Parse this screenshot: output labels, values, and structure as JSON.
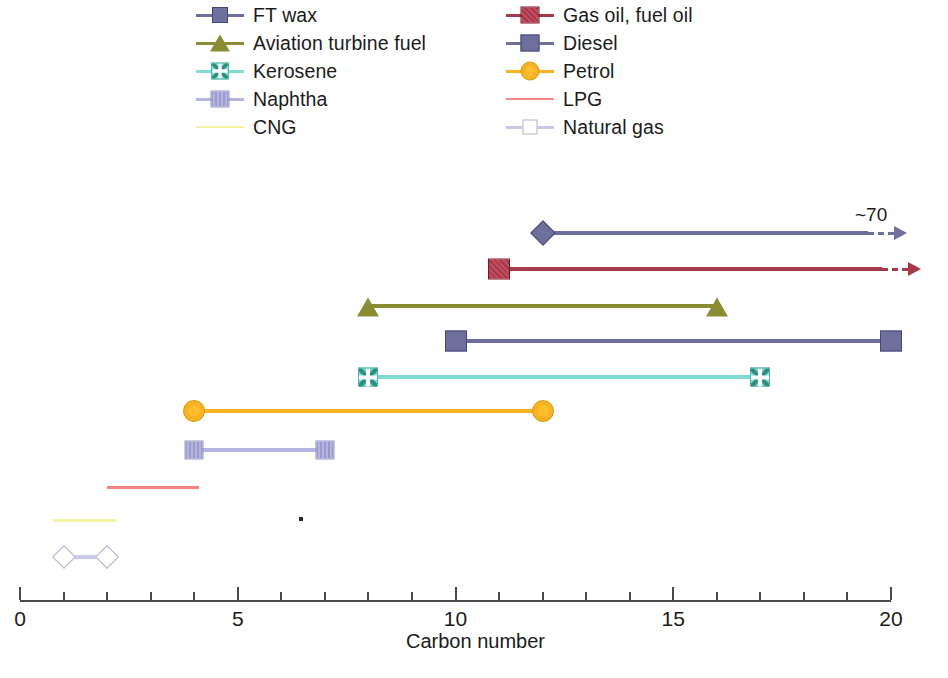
{
  "chart_data": {
    "type": "bar",
    "subtype": "horizontal-range-bars",
    "title": "",
    "xlabel": "Carbon number",
    "ylabel": "",
    "xlim": [
      0,
      20
    ],
    "xticks": [
      0,
      5,
      10,
      15,
      20
    ],
    "xtick_labels": [
      "0",
      "5",
      "10",
      "15",
      "20"
    ],
    "xminor_ticks": [
      1,
      2,
      3,
      4,
      6,
      7,
      8,
      9,
      11,
      12,
      13,
      14,
      16,
      17,
      18,
      19
    ],
    "grid": false,
    "legend_position": "top",
    "series": [
      {
        "name": "FT wax",
        "start": 12,
        "end": 70,
        "end_label": "~70",
        "open_ended": true,
        "marker": "diamond",
        "color": "#6f6f9e",
        "row": 0
      },
      {
        "name": "Gas oil, fuel oil",
        "start": 11,
        "end": 21,
        "end_label": "",
        "open_ended": true,
        "marker": "square-hatched",
        "color": "#a8394a",
        "row": 1
      },
      {
        "name": "Aviation turbine fuel",
        "start": 8,
        "end": 16,
        "end_label": "",
        "open_ended": false,
        "marker": "triangle",
        "color": "#8a8c33",
        "row": 2
      },
      {
        "name": "Diesel",
        "start": 10,
        "end": 20,
        "end_label": "",
        "open_ended": false,
        "marker": "square",
        "color": "#6f6f9e",
        "row": 3
      },
      {
        "name": "Kerosene",
        "start": 8,
        "end": 17,
        "end_label": "",
        "open_ended": false,
        "marker": "x-square",
        "color": "#7edcd2",
        "row": 4
      },
      {
        "name": "Petrol",
        "start": 4,
        "end": 12,
        "end_label": "",
        "open_ended": false,
        "marker": "circle",
        "color": "#f6b323",
        "row": 5
      },
      {
        "name": "Naphtha",
        "start": 4,
        "end": 7,
        "end_label": "",
        "open_ended": false,
        "marker": "square-hatched-light",
        "color": "#b5b5e3",
        "row": 6
      },
      {
        "name": "LPG",
        "start": 2,
        "end": 4.1,
        "end_label": "",
        "open_ended": false,
        "marker": "none",
        "color": "#f88383",
        "row": 7
      },
      {
        "name": "CNG",
        "start": 0.75,
        "end": 2.2,
        "end_label": "",
        "open_ended": false,
        "marker": "none",
        "color": "#f4f4a2",
        "row": 8
      },
      {
        "name": "Natural gas",
        "start": 1,
        "end": 2,
        "end_label": "",
        "open_ended": false,
        "marker": "diamond-open",
        "color": "#c9c9e8",
        "row": 9
      }
    ]
  },
  "legend": {
    "left_column": [
      {
        "label": "FT wax",
        "marker": "diamond",
        "color": "#6f6f9e"
      },
      {
        "label": "Aviation turbine fuel",
        "marker": "triangle",
        "color": "#8a8c33"
      },
      {
        "label": "Kerosene",
        "marker": "x-square",
        "color": "#7edcd2"
      },
      {
        "label": "Naphtha",
        "marker": "square-hatched-light",
        "color": "#b5b5e3"
      },
      {
        "label": "CNG",
        "marker": "none",
        "color": "#f4f4a2"
      }
    ],
    "right_column": [
      {
        "label": "Gas oil, fuel oil",
        "marker": "square-hatched",
        "color": "#a8394a"
      },
      {
        "label": "Diesel",
        "marker": "square",
        "color": "#6f6f9e"
      },
      {
        "label": "Petrol",
        "marker": "circle",
        "color": "#f6b323"
      },
      {
        "label": "LPG",
        "marker": "none",
        "color": "#f88383"
      },
      {
        "label": "Natural gas",
        "marker": "diamond-open",
        "color": "#c9c9e8"
      }
    ]
  },
  "axis": {
    "label": "Carbon number",
    "tick_labels": [
      "0",
      "5",
      "10",
      "15",
      "20"
    ]
  },
  "annotations": {
    "ft_wax_tip": "~70"
  }
}
